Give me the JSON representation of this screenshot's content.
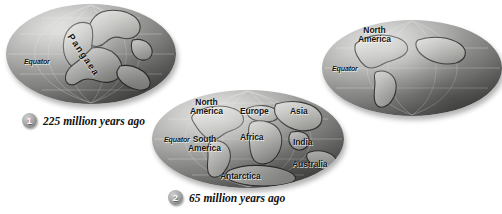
{
  "figure": {
    "background_color": "#ffffff",
    "land_color": "#c9c9c6",
    "ocean_color": "#8f8f8d",
    "label_color": "#141414"
  },
  "globes": [
    {
      "id": "globe-pangaea",
      "equator_label": "Equator",
      "supercontinent_label": "Pangaea",
      "continents": [],
      "caption": {
        "number": "1",
        "text": "225 million years ago"
      }
    },
    {
      "id": "globe-modern-continents",
      "equator_label": "Equator",
      "supercontinent_label": "",
      "continents": [
        {
          "name": "North America",
          "lines": [
            "North",
            "America"
          ]
        },
        {
          "name": "Europe",
          "lines": [
            "Europe"
          ]
        },
        {
          "name": "Asia",
          "lines": [
            "Asia"
          ]
        },
        {
          "name": "Africa",
          "lines": [
            "Africa"
          ]
        },
        {
          "name": "India",
          "lines": [
            "India"
          ]
        },
        {
          "name": "South America",
          "lines": [
            "South",
            "America"
          ]
        },
        {
          "name": "Australia",
          "lines": [
            "Australia"
          ]
        },
        {
          "name": "Antarctica",
          "lines": [
            "Antarctica"
          ]
        }
      ],
      "caption": {
        "number": "2",
        "text": "65 million years ago"
      }
    },
    {
      "id": "globe-present-day",
      "equator_label": "Equator",
      "supercontinent_label": "",
      "continents": [
        {
          "name": "North America",
          "lines": [
            "North",
            "America"
          ]
        }
      ],
      "caption": {
        "number": "",
        "text": ""
      }
    }
  ]
}
